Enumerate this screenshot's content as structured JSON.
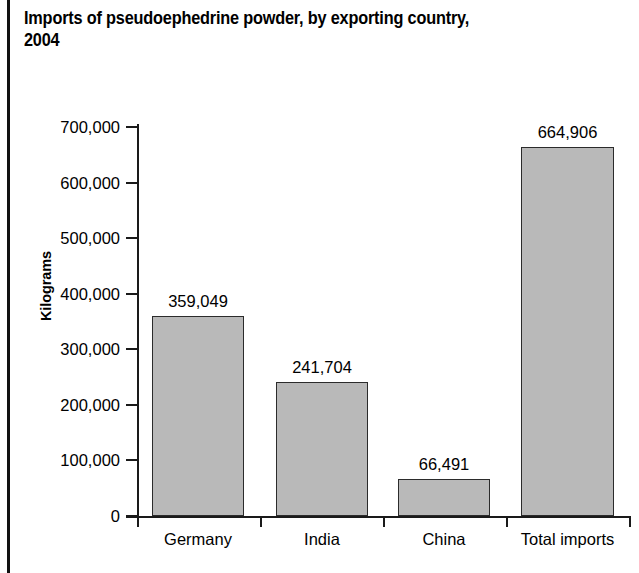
{
  "figure": {
    "title": "Imports of pseudoephedrine powder, by exporting country,\n2004",
    "background_color": "#ffffff",
    "bar_fill_color": "#b9b9b9",
    "bar_border_color": "#2b2b2b",
    "axis_color": "#1a1a1a",
    "text_color": "#000000"
  },
  "chart_data": {
    "type": "bar",
    "title": "Imports of pseudoephedrine powder, by exporting country, 2004",
    "subtitle": "",
    "xlabel": "",
    "ylabel": "Kilograms",
    "categories": [
      "Germany",
      "India",
      "China",
      "Total imports"
    ],
    "values": [
      359049,
      241704,
      66491,
      664906
    ],
    "value_labels": [
      "359,049",
      "241,704",
      "66,491",
      "664,906"
    ],
    "ylim": [
      0,
      700000
    ],
    "ytick_values": [
      0,
      100000,
      200000,
      300000,
      400000,
      500000,
      600000,
      700000
    ],
    "ytick_labels": [
      "0",
      "100,000",
      "200,000",
      "300,000",
      "400,000",
      "500,000",
      "600,000",
      "700,000"
    ],
    "grid": false,
    "legend": null,
    "legend_position": "none",
    "annotations": []
  }
}
